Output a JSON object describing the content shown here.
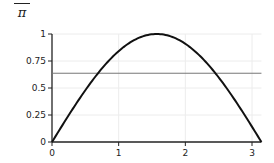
{
  "annotation": {
    "numerator": "2",
    "denominator": "π"
  },
  "chart_data": {
    "type": "line",
    "title": "",
    "xlabel": "",
    "ylabel": "",
    "xlim": [
      0,
      3.14159
    ],
    "ylim": [
      0,
      1
    ],
    "grid": true,
    "legend": "none",
    "x_ticks": [
      0,
      1,
      2,
      3
    ],
    "x_tick_labels": [
      "0",
      "1",
      "2",
      "3"
    ],
    "y_ticks": [
      0,
      0.25,
      0.5,
      0.75,
      1
    ],
    "y_tick_labels": [
      "0",
      "0.25",
      "0.5",
      "0.75",
      "1"
    ],
    "series": [
      {
        "name": "sin(x)",
        "color": "#111111",
        "x": [
          0,
          0.1571,
          0.3142,
          0.4712,
          0.6283,
          0.7854,
          0.9425,
          1.0996,
          1.2566,
          1.4137,
          1.5708,
          1.7279,
          1.885,
          2.042,
          2.1991,
          2.3562,
          2.5133,
          2.6704,
          2.8274,
          2.9845,
          3.1416
        ],
        "y": [
          0,
          0.1564,
          0.309,
          0.454,
          0.5878,
          0.7071,
          0.809,
          0.891,
          0.9511,
          0.9877,
          1,
          0.9877,
          0.9511,
          0.891,
          0.809,
          0.7071,
          0.5878,
          0.454,
          0.309,
          0.1564,
          0
        ]
      },
      {
        "name": "2/π",
        "color": "#777777",
        "x": [
          0,
          3.1416
        ],
        "y": [
          0.6366,
          0.6366
        ]
      }
    ],
    "annotations": [
      "2/π"
    ]
  },
  "colors": {
    "axis": "#222222",
    "grid": "#ececec",
    "curve": "#111111",
    "mean_line": "#777777"
  }
}
